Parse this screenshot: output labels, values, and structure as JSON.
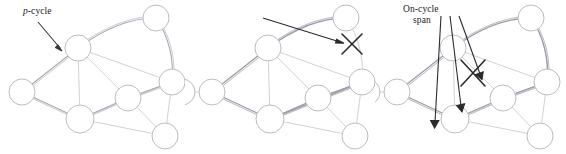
{
  "figure": {
    "background": "#ffffff",
    "width": 566,
    "height": 154
  },
  "colors": {
    "node_stroke": "#b9b9be",
    "span_light": "#d2d2d8",
    "cycle_stroke": "#9a9aa6",
    "annotation": "#2b2b2b",
    "text": "#1a1a1a"
  },
  "panels": [
    {
      "id": "panel-a",
      "name": "p-cycle",
      "label": {
        "prefix_italic": "p",
        "suffix": "-cycle",
        "full_text": "p-cycle"
      },
      "arrows": [
        {
          "name": "p-cycle-pointer",
          "x1": 38,
          "y1": 22,
          "x2": 62,
          "y2": 50
        }
      ],
      "x_marks": [],
      "nodes": [
        {
          "id": "n1",
          "cx": 78,
          "cy": 48,
          "r": 13
        },
        {
          "id": "n2",
          "cx": 156,
          "cy": 18,
          "r": 13
        },
        {
          "id": "n3",
          "cx": 172,
          "cy": 82,
          "r": 13
        },
        {
          "id": "n4",
          "cx": 128,
          "cy": 98,
          "r": 13
        },
        {
          "id": "n5",
          "cx": 80,
          "cy": 119,
          "r": 14
        },
        {
          "id": "n6",
          "cx": 22,
          "cy": 92,
          "r": 13
        },
        {
          "id": "n7",
          "cx": 165,
          "cy": 136,
          "r": 13
        }
      ],
      "spans": [
        {
          "from": "n1",
          "to": "n2"
        },
        {
          "from": "n1",
          "to": "n3"
        },
        {
          "from": "n1",
          "to": "n4"
        },
        {
          "from": "n1",
          "to": "n5"
        },
        {
          "from": "n1",
          "to": "n6"
        },
        {
          "from": "n2",
          "to": "n3"
        },
        {
          "from": "n3",
          "to": "n4"
        },
        {
          "from": "n3",
          "to": "n7"
        },
        {
          "from": "n4",
          "to": "n5"
        },
        {
          "from": "n4",
          "to": "n7"
        },
        {
          "from": "n5",
          "to": "n6"
        },
        {
          "from": "n5",
          "to": "n7"
        },
        {
          "from": "n5",
          "to": "n3"
        }
      ],
      "cycle_nodes": [
        "n1",
        "n2",
        "n3",
        "n4",
        "n5",
        "n6"
      ]
    },
    {
      "id": "panel-b",
      "name": "on-cycle span failure",
      "label": {
        "line1": "On-cycle",
        "line2": "span",
        "full_text": "On-cycle span"
      },
      "arrows": [
        {
          "name": "on-cycle-span-pointer",
          "x1": 78,
          "y1": 18,
          "x2": 158,
          "y2": 42
        }
      ],
      "x_marks": [
        {
          "name": "failed-span-x",
          "cx": 167,
          "cy": 44,
          "size": 11
        }
      ]
    },
    {
      "id": "panel-c",
      "name": "straddling spans",
      "label": {
        "line1": "Straddling spans",
        "full_text": "Straddling spans"
      },
      "arrows": [
        {
          "name": "straddling-arrow-1",
          "x1": 68,
          "y1": 17,
          "x2": 62,
          "y2": 128
        },
        {
          "name": "straddling-arrow-2",
          "x1": 76,
          "y1": 17,
          "x2": 88,
          "y2": 112
        },
        {
          "name": "straddling-arrow-3",
          "x1": 84,
          "y1": 17,
          "x2": 107,
          "y2": 80
        }
      ],
      "x_marks": [
        {
          "name": "failed-straddling-span-x",
          "cx": 98,
          "cy": 72,
          "size": 13
        }
      ]
    }
  ]
}
